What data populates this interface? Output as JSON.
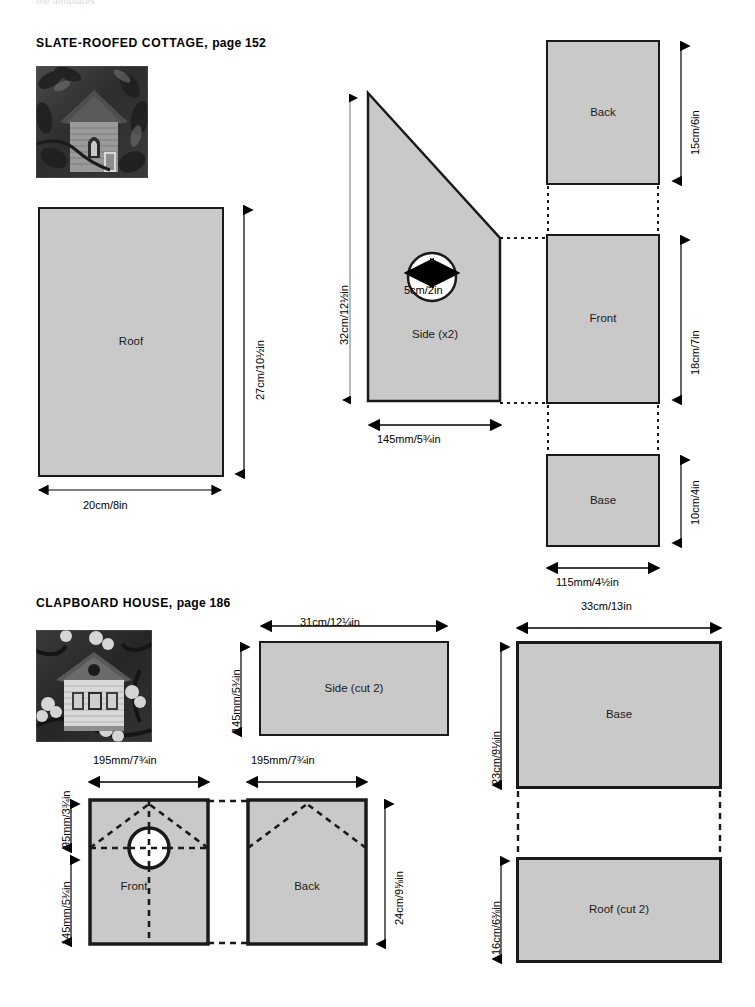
{
  "page": {
    "running_header": "the templates",
    "width": 755,
    "height": 1007,
    "piece_fill": "#c9c9c9",
    "piece_stroke": "#1a1a1a"
  },
  "projects": [
    {
      "id": "slate-roofed-cottage",
      "title": "SLATE-ROOFED COTTAGE,",
      "page_ref": "page 152",
      "photo_alt": "slate-roofed cottage birdhouse photograph",
      "pieces": [
        {
          "id": "roof",
          "label": "Roof",
          "shape": "rectangle",
          "width_dim": "20cm/8in",
          "height_dim": "27cm/10½in"
        },
        {
          "id": "side",
          "label": "Side (x2)",
          "shape": "polygon",
          "width_dim": "145mm/5¾in",
          "height_dim": "32cm/12½in",
          "hole_dim": "5cm/2in"
        },
        {
          "id": "back",
          "label": "Back",
          "shape": "rectangle",
          "height_dim": "15cm/6in"
        },
        {
          "id": "front",
          "label": "Front",
          "shape": "rectangle",
          "height_dim": "18cm/7in"
        },
        {
          "id": "base",
          "label": "Base",
          "shape": "rectangle",
          "width_dim": "115mm/4½in",
          "height_dim": "10cm/4in"
        }
      ]
    },
    {
      "id": "clapboard-house",
      "title": "CLAPBOARD HOUSE,",
      "page_ref": "page 186",
      "photo_alt": "clapboard house birdhouse photograph",
      "pieces": [
        {
          "id": "side",
          "label": "Side (cut 2)",
          "shape": "rectangle",
          "width_dim": "31cm/12¼in",
          "height_dim": "145mm/5¾in"
        },
        {
          "id": "front",
          "label": "Front",
          "shape": "rectangle-with-hole",
          "width_dim": "195mm/7¾in",
          "upper_dim": "95mm/3¾in",
          "lower_dim": "145mm/5¾in"
        },
        {
          "id": "back",
          "label": "Back",
          "shape": "rectangle",
          "width_dim": "195mm/7¾in",
          "height_dim": "24cm/9⅝in"
        },
        {
          "id": "base",
          "label": "Base",
          "shape": "rectangle",
          "width_dim": "33cm/13in",
          "height_dim": "23cm/9⅛in"
        },
        {
          "id": "roof",
          "label": "Roof (cut 2)",
          "shape": "rectangle",
          "height_dim": "16cm/6⅜in"
        }
      ]
    }
  ]
}
